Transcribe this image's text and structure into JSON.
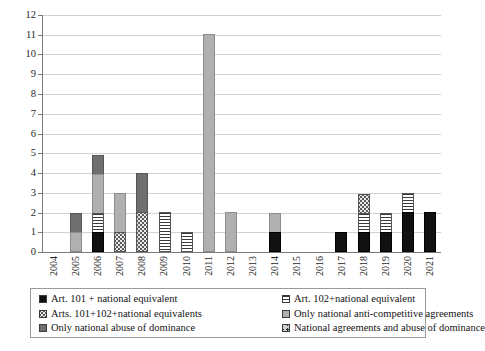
{
  "chart_data": {
    "type": "bar",
    "subtype": "stacked",
    "title": "",
    "xlabel": "",
    "ylabel": "",
    "ylim": [
      0,
      12
    ],
    "ytick_step": 1,
    "grid": "horizontal",
    "legend_position": "bottom",
    "categories": [
      "2004",
      "2005",
      "2006",
      "2007",
      "2008",
      "2009",
      "2010",
      "2011",
      "2012",
      "2013",
      "2014",
      "2015",
      "2016",
      "2017",
      "2018",
      "2019",
      "2020",
      "2021"
    ],
    "ytick_labels": [
      "12",
      "11",
      "10",
      "9",
      "8",
      "7",
      "6",
      "5",
      "4",
      "3",
      "2",
      "1",
      "0"
    ],
    "series": [
      {
        "name": "Art. 101 + national equivalent",
        "pattern": "solid-black",
        "color": "#111111",
        "values": [
          0,
          0,
          1,
          0,
          0,
          0,
          0,
          0,
          0,
          0,
          1,
          0,
          0,
          1,
          1,
          1,
          2,
          2
        ]
      },
      {
        "name": "Art. 102+national equivalent",
        "pattern": "horizontal-stripes",
        "color": "#3a3a3a",
        "values": [
          0,
          0,
          1,
          0,
          0,
          2,
          1,
          0,
          0,
          0,
          0,
          0,
          0,
          0,
          1,
          1,
          1,
          0
        ]
      },
      {
        "name": "Arts. 101+102+national equivalents",
        "pattern": "fine-dots",
        "color": "#e8e8e8",
        "values": [
          0,
          0,
          0,
          1,
          2,
          0,
          0,
          0,
          0,
          0,
          0,
          0,
          0,
          0,
          1,
          0,
          0,
          0
        ]
      },
      {
        "name": "Only national anti-competitive agreements",
        "pattern": "light-gray",
        "color": "#b0b0b0",
        "values": [
          0,
          1,
          2,
          2,
          0,
          0,
          0,
          11,
          2,
          0,
          1,
          0,
          0,
          0,
          0,
          0,
          0,
          0
        ]
      },
      {
        "name": "Only national abuse of dominance",
        "pattern": "dark-gray",
        "color": "#6f6f6f",
        "values": [
          0,
          1,
          1,
          0,
          2,
          0,
          0,
          0,
          0,
          0,
          0,
          0,
          0,
          0,
          0,
          0,
          0,
          0
        ]
      },
      {
        "name": "National agreements and abuse of dominance",
        "pattern": "square-dot",
        "color": "#cfcfcf",
        "values": [
          0,
          0,
          0,
          0,
          0,
          0,
          0,
          0,
          0,
          0,
          0,
          0,
          0,
          0,
          0,
          0,
          0,
          0
        ]
      }
    ],
    "totals": [
      0,
      2,
      5,
      3,
      4,
      2,
      1,
      11,
      2,
      0,
      2,
      0,
      0,
      1,
      3,
      2,
      3,
      2
    ]
  },
  "legend": {
    "items": [
      {
        "label": "Art. 101 + national equivalent",
        "pattern": "solid-black"
      },
      {
        "label": "Art. 102+national equivalent",
        "pattern": "horizontal-stripes"
      },
      {
        "label": "Arts. 101+102+national equivalents",
        "pattern": "fine-dots"
      },
      {
        "label": "Only national anti-competitive agreements",
        "pattern": "light-gray"
      },
      {
        "label": "Only national abuse of dominance",
        "pattern": "dark-gray"
      },
      {
        "label": "National agreements and abuse of dominance",
        "pattern": "square-dot"
      }
    ]
  }
}
